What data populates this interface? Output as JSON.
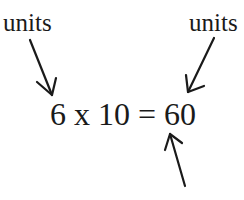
{
  "labels": {
    "left": "units",
    "right": "units"
  },
  "equation": "6 x 10 = 60",
  "arrows": [
    {
      "name": "left-arrow",
      "points_to": "6"
    },
    {
      "name": "right-arrow",
      "points_to": "10"
    },
    {
      "name": "bottom-arrow",
      "points_to": "60"
    }
  ],
  "colors": {
    "ink": "#1a1a1a",
    "background": "#ffffff"
  }
}
